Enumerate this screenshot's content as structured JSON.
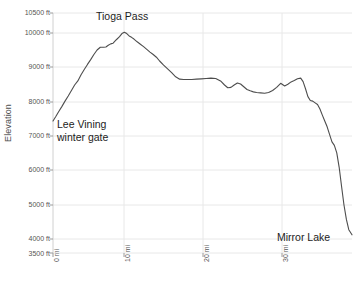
{
  "chart_data": {
    "type": "line",
    "title": "",
    "xlabel": "",
    "ylabel": "Elevation",
    "xlim": [
      0,
      37.3
    ],
    "ylim": [
      3500,
      10500
    ],
    "grid": true,
    "legend": "none",
    "x_unit": "mi",
    "y_unit": "ft",
    "y_ticks": [
      3500,
      4000,
      5000,
      6000,
      7000,
      8000,
      9000,
      10000,
      10500
    ],
    "y_tick_labels": [
      "3500 ft",
      "4000 ft",
      "5000 ft",
      "6000 ft",
      "7000 ft",
      "8000 ft",
      "9000 ft",
      "10000 ft",
      "10500 ft"
    ],
    "x_ticks": [
      0,
      10,
      20,
      30
    ],
    "x_tick_labels": [
      "0 mi",
      "10 mi",
      "20 mi",
      "30 mi"
    ],
    "line_color": "#4d4d4d",
    "grid_color": "#e8e8e8",
    "series": [
      {
        "name": "Tioga Road elevation profile",
        "x": [
          0.0,
          0.35,
          0.7,
          1.1,
          1.5,
          1.9,
          2.3,
          2.7,
          3.1,
          3.5,
          3.9,
          4.3,
          4.7,
          5.1,
          5.5,
          5.9,
          6.3,
          6.6,
          6.9,
          7.2,
          7.5,
          7.9,
          8.3,
          8.6,
          8.9,
          9.2,
          9.5,
          9.8,
          10.1,
          10.5,
          10.9,
          11.3,
          11.7,
          12.1,
          12.5,
          12.9,
          13.3,
          13.8,
          14.3,
          14.8,
          15.3,
          15.8,
          16.3,
          16.8,
          17.3,
          17.9,
          18.5,
          19.1,
          19.7,
          20.3,
          20.9,
          21.4,
          21.8,
          22.2,
          22.6,
          23.0,
          23.4,
          23.8,
          24.2,
          24.6,
          25.0,
          25.4,
          25.9,
          26.4,
          26.9,
          27.4,
          27.9,
          28.4,
          28.9,
          29.3,
          29.7,
          30.1,
          30.5,
          30.9,
          31.2,
          31.5,
          31.8,
          32.1,
          32.4,
          32.7,
          33.0,
          33.3,
          33.6,
          33.9,
          34.2,
          34.5,
          34.8,
          35.1,
          35.4,
          35.7,
          36.0,
          36.3,
          36.6,
          36.9,
          37.3
        ],
        "y": [
          7350,
          7480,
          7620,
          7770,
          7930,
          8080,
          8240,
          8400,
          8520,
          8700,
          8850,
          9000,
          9140,
          9290,
          9420,
          9500,
          9500,
          9510,
          9560,
          9600,
          9620,
          9720,
          9810,
          9900,
          9940,
          9900,
          9830,
          9790,
          9740,
          9660,
          9590,
          9520,
          9440,
          9360,
          9290,
          9210,
          9100,
          8980,
          8870,
          8760,
          8640,
          8570,
          8560,
          8560,
          8560,
          8570,
          8580,
          8590,
          8600,
          8590,
          8520,
          8400,
          8320,
          8330,
          8400,
          8460,
          8430,
          8350,
          8270,
          8230,
          8200,
          8180,
          8170,
          8160,
          8180,
          8240,
          8330,
          8450,
          8370,
          8420,
          8490,
          8530,
          8580,
          8600,
          8500,
          8290,
          8060,
          7950,
          7930,
          7880,
          7830,
          7700,
          7520,
          7350,
          7180,
          6960,
          6740,
          6640,
          6420,
          6000,
          5440,
          4900,
          4480,
          4180,
          4030
        ],
        "notes": "Elevation profile descending Tioga Road from Lee Vining winter gate over Tioga Pass to Mirror Lake in Yosemite Valley"
      }
    ],
    "annotations": [
      {
        "label": "Tioga Pass",
        "x_mi": 8.9,
        "y_ft": 9940,
        "role": "peak-summit"
      },
      {
        "label": "Lee Vining winter gate",
        "x_mi": 0.0,
        "y_ft": 7350,
        "role": "start-point"
      },
      {
        "label": "Mirror Lake",
        "x_mi": 37.3,
        "y_ft": 4030,
        "role": "end-point"
      }
    ]
  }
}
